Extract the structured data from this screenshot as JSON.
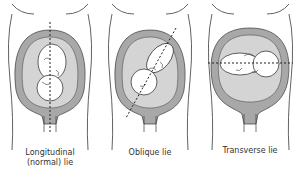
{
  "diagram": {
    "colors": {
      "outline": "#3a3a3a",
      "uterus_wall": "#a8a8a8",
      "amniotic_fluid": "#d4d4d4",
      "fetus_fill": "#ffffff",
      "axis_line": "#222222",
      "background": "#ffffff"
    },
    "panels": [
      {
        "id": "longitudinal",
        "label_line1": "Longitudinal",
        "label_line2": "(normal) lie",
        "axis": "vertical"
      },
      {
        "id": "oblique",
        "label_line1": "Oblique lie",
        "label_line2": "",
        "axis": "diagonal"
      },
      {
        "id": "transverse",
        "label_line1": "Transverse lie",
        "label_line2": "",
        "axis": "horizontal"
      }
    ]
  }
}
